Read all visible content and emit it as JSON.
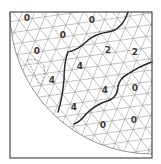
{
  "diagram": {
    "type": "triangular-mesh-quarter-disk",
    "frame": {
      "x": 10,
      "y": 12,
      "width": 142,
      "height": 146
    },
    "colors": {
      "mesh": "#9a9a9a",
      "boundary": "#2b2b2b",
      "frame": "#4a4a4a",
      "label": "#3a3a3a",
      "background": "#ffffff"
    },
    "arc": {
      "cx": 152,
      "cy": 12,
      "r": 142
    },
    "regions": [
      {
        "id": "outer",
        "value": "0"
      },
      {
        "id": "band",
        "value": "2"
      },
      {
        "id": "core",
        "value": "4"
      }
    ],
    "labels": [
      {
        "text": "0",
        "x": 27,
        "y": 18
      },
      {
        "text": "0",
        "x": 92,
        "y": 20
      },
      {
        "text": "0",
        "x": 63,
        "y": 35
      },
      {
        "text": "0",
        "x": 37,
        "y": 51
      },
      {
        "text": "2",
        "x": 108,
        "y": 50
      },
      {
        "text": "2",
        "x": 135,
        "y": 52
      },
      {
        "text": "4",
        "x": 80,
        "y": 66
      },
      {
        "text": "4",
        "x": 52,
        "y": 80
      },
      {
        "text": "4",
        "x": 105,
        "y": 90
      },
      {
        "text": "4",
        "x": 74,
        "y": 107
      },
      {
        "text": "0",
        "x": 135,
        "y": 88
      },
      {
        "text": "0",
        "x": 103,
        "y": 125
      },
      {
        "text": "0",
        "x": 134,
        "y": 120
      }
    ]
  }
}
